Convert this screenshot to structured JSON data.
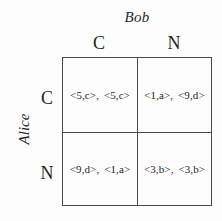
{
  "figure": {
    "type": "normal-form-game-payoff-matrix",
    "row_player": "Alice",
    "column_player": "Bob",
    "row_strategies": [
      "C",
      "N"
    ],
    "column_strategies": [
      "C",
      "N"
    ],
    "cells": [
      [
        {
          "row_payoff": "<5,c>",
          "col_payoff": "<5,c>",
          "separator": ","
        },
        {
          "row_payoff": "<1,a>",
          "col_payoff": "<9,d>",
          "separator": ","
        }
      ],
      [
        {
          "row_payoff": "<9,d>",
          "col_payoff": "<1,a>",
          "separator": ","
        },
        {
          "row_payoff": "<3,b>",
          "col_payoff": "<3,b>",
          "separator": ","
        }
      ]
    ],
    "colors": {
      "background": "#fdfdfd",
      "grid_line": "#4a4a4a",
      "text": "#262626"
    }
  }
}
